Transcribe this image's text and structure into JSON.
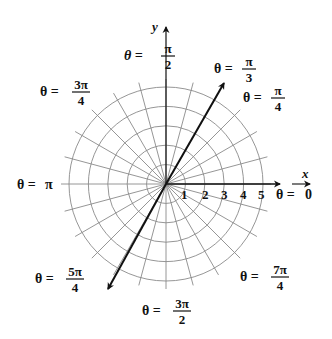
{
  "diagram": {
    "type": "polar-coordinate-grid",
    "axes": {
      "x_label": "x",
      "y_label": "y"
    },
    "radial_ticks": [
      "1",
      "2",
      "3",
      "4",
      "5"
    ],
    "angle_labels": [
      {
        "id": "theta-0",
        "lhs": "θ =",
        "num": "0",
        "den": ""
      },
      {
        "id": "theta-pi-3",
        "lhs": "θ =",
        "num": "π",
        "den": "3"
      },
      {
        "id": "theta-pi-4",
        "lhs": "θ =",
        "num": "π",
        "den": "4"
      },
      {
        "id": "theta-pi-2",
        "lhs": "θ =",
        "num": "π",
        "den": "2"
      },
      {
        "id": "theta-3pi-4",
        "lhs": "θ =",
        "num": "3π",
        "den": "4"
      },
      {
        "id": "theta-pi",
        "lhs": "θ =",
        "num": "π",
        "den": ""
      },
      {
        "id": "theta-5pi-4",
        "lhs": "θ =",
        "num": "5π",
        "den": "4"
      },
      {
        "id": "theta-3pi-2",
        "lhs": "θ =",
        "num": "3π",
        "den": "2"
      },
      {
        "id": "theta-7pi-4",
        "lhs": "θ =",
        "num": "7π",
        "den": "4"
      }
    ],
    "highlighted_ray_angle": "π/3",
    "colors": {
      "grid": "#8a8a8a",
      "axis": "#111111",
      "background": "#ffffff"
    }
  }
}
